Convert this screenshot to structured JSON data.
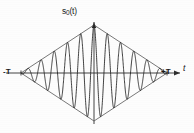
{
  "figure": {
    "title_label": "s",
    "title_sub": "0",
    "title_suffix": "(t)",
    "x_axis_label": "t",
    "left_tick_label": "-T",
    "right_tick_label": "+T",
    "colors": {
      "axis": "#2e2e2e",
      "envelope": "#555555",
      "signal": "#1f1f1f",
      "background": "#fdfdfd"
    }
  },
  "chart_data": {
    "type": "line",
    "title": "s0(t)",
    "xlabel": "t",
    "ylabel": "",
    "xlim": [
      -1,
      1
    ],
    "ylim": [
      -1,
      1
    ],
    "grid": false,
    "legend": null,
    "envelope": {
      "type": "triangular",
      "upper_points": [
        [
          -1,
          0
        ],
        [
          0,
          1
        ],
        [
          1,
          0
        ]
      ],
      "lower_points": [
        [
          -1,
          0
        ],
        [
          0,
          -1
        ],
        [
          1,
          0
        ]
      ]
    },
    "annotations": [
      {
        "text": "s0(t)",
        "x": 0,
        "y": 1.18,
        "role": "y-axis-label"
      },
      {
        "text": "-T",
        "x": -1,
        "y": 0,
        "role": "x-tick"
      },
      {
        "text": "+T",
        "x": 1,
        "y": 0,
        "role": "x-tick"
      },
      {
        "text": "t",
        "x": 1.22,
        "y": 0,
        "role": "x-axis-label"
      }
    ],
    "x": [
      -1.0,
      -0.98,
      -0.96,
      -0.94,
      -0.92,
      -0.9,
      -0.88,
      -0.86,
      -0.84,
      -0.82,
      -0.8,
      -0.78,
      -0.76,
      -0.74,
      -0.72,
      -0.7,
      -0.68,
      -0.66,
      -0.64,
      -0.62,
      -0.6,
      -0.58,
      -0.56,
      -0.54,
      -0.52,
      -0.5,
      -0.48,
      -0.46,
      -0.44,
      -0.42,
      -0.4,
      -0.38,
      -0.36,
      -0.34,
      -0.32,
      -0.3,
      -0.28,
      -0.26,
      -0.24,
      -0.22,
      -0.2,
      -0.18,
      -0.16,
      -0.14,
      -0.12,
      -0.1,
      -0.08,
      -0.06,
      -0.04,
      -0.02,
      0.0,
      0.02,
      0.04,
      0.06,
      0.08,
      0.1,
      0.12,
      0.14,
      0.16,
      0.18,
      0.2,
      0.22,
      0.24,
      0.26,
      0.28,
      0.3,
      0.32,
      0.34,
      0.36,
      0.38,
      0.4,
      0.42,
      0.44,
      0.46,
      0.48,
      0.5,
      0.52,
      0.54,
      0.56,
      0.58,
      0.6,
      0.62,
      0.64,
      0.66,
      0.68,
      0.7,
      0.72,
      0.74,
      0.76,
      0.78,
      0.8,
      0.82,
      0.84,
      0.86,
      0.88,
      0.9,
      0.92,
      0.94,
      0.96,
      0.98,
      1.0
    ],
    "cycles": 11,
    "formula": "s0(t) = (1 - |t|/T) * cos(11*pi*t/T)",
    "peak_count_upper": 11,
    "peak_count_lower": 11,
    "max_amplitude": 1.0,
    "min_amplitude": -1.0
  }
}
